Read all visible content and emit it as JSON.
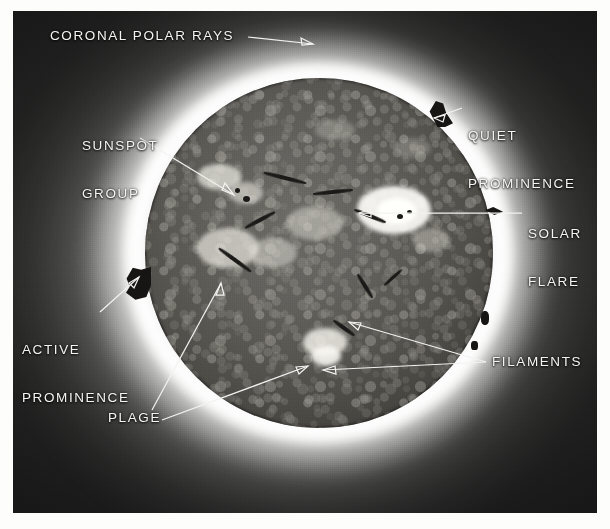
{
  "figure": {
    "kind": "annotated-photograph",
    "medium": "black-and-white halftone plate",
    "plate": {
      "x": 13,
      "y": 11,
      "width": 584,
      "height": 502
    },
    "disk": {
      "center_x": 318,
      "center_y": 253,
      "radius": 174
    }
  },
  "annotations": [
    {
      "id": "coronal-polar-rays",
      "label_line1": "CORONAL POLAR RAYS",
      "label_line2": "",
      "align": "left",
      "label_x": 50,
      "label_y": 28,
      "leader": [
        [
          248,
          37
        ],
        [
          308,
          44
        ]
      ],
      "arrow": "right",
      "target": "outer corona above north pole"
    },
    {
      "id": "sunspot-group",
      "label_line1": "SUNSPOT",
      "label_line2": "GROUP",
      "align": "left",
      "label_x": 82,
      "label_y": 106,
      "leader": [
        [
          140,
          138
        ],
        [
          232,
          192
        ]
      ],
      "arrow": "down-right",
      "target": "dark sunspot pair, upper-left quadrant of disk"
    },
    {
      "id": "quiet-prominence",
      "label_line1": "QUIET",
      "label_line2": "PROMINENCE",
      "align": "left",
      "label_x": 468,
      "label_y": 96,
      "leader": [
        [
          462,
          108
        ],
        [
          435,
          118
        ]
      ],
      "arrow": "left",
      "target": "hook-shaped prominence on north-east limb"
    },
    {
      "id": "solar-flare",
      "label_line1": "SOLAR",
      "label_line2": "FLARE",
      "align": "left",
      "label_x": 528,
      "label_y": 194,
      "leader": [
        [
          522,
          213
        ],
        [
          420,
          213
        ]
      ],
      "arrow": "left",
      "target": "bright emission region, right of disk centre"
    },
    {
      "id": "active-prominence",
      "label_line1": "ACTIVE",
      "label_line2": "PROMINENCE",
      "align": "left",
      "label_x": 22,
      "label_y": 310,
      "leader": [
        [
          100,
          312
        ],
        [
          137,
          280
        ]
      ],
      "arrow": "up-right",
      "target": "jagged prominence on west limb"
    },
    {
      "id": "plage",
      "label_line1": "PLAGE",
      "label_line2": "",
      "align": "left",
      "label_x": 108,
      "label_y": 410,
      "leader": [
        [
          152,
          410
        ],
        [
          219,
          284
        ]
      ],
      "arrow": "up-right",
      "target": "bright plage area, lower-left quadrant"
    },
    {
      "id": "plage-2",
      "label_line1": "",
      "label_line2": "",
      "align": "left",
      "label_x": 0,
      "label_y": 0,
      "leader": [
        [
          162,
          420
        ],
        [
          307,
          366
        ]
      ],
      "arrow": "up-right",
      "target": "second bright plage near disk centre-bottom"
    },
    {
      "id": "filaments",
      "label_line1": "FILAMENTS",
      "label_line2": "",
      "align": "left",
      "label_x": 492,
      "label_y": 354,
      "leader": [
        [
          486,
          362
        ],
        [
          348,
          322
        ]
      ],
      "arrow": "left",
      "target": "dark curved filament, lower-right of centre"
    },
    {
      "id": "filaments-2",
      "label_line1": "",
      "label_line2": "",
      "align": "left",
      "label_x": 0,
      "label_y": 0,
      "leader": [
        [
          486,
          362
        ],
        [
          322,
          370
        ]
      ],
      "arrow": "left",
      "target": "second dark filament below centre"
    }
  ],
  "palette": {
    "plate_sky": "#1a1a1a",
    "corona_white": "#ffffff",
    "disk_mid": "#56544f",
    "label_text": "#f4f4f2",
    "leader_line": "#f2f2f0",
    "page_background": "#fdfdfc"
  }
}
